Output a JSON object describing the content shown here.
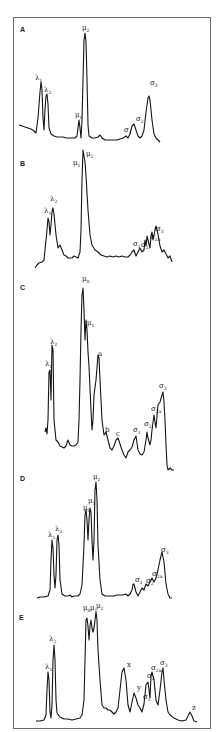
{
  "figure": {
    "panels": [
      {
        "id": "A",
        "letter": "A",
        "peak_labels": [
          "λ1",
          "λ2",
          "μ1",
          "μ2",
          "σ1",
          "σ2",
          "σ3"
        ]
      },
      {
        "id": "B",
        "letter": "B",
        "peak_labels": [
          "λ1",
          "λ2",
          "μ1",
          "μ2",
          "σ1",
          "σ2",
          "σ2a",
          "σ3"
        ]
      },
      {
        "id": "C",
        "letter": "C",
        "peak_labels": [
          "λ1",
          "λ2",
          "μ0",
          "μ1",
          "a",
          "b",
          "c",
          "σ1",
          "σ2",
          "σ2a",
          "σ3"
        ]
      },
      {
        "id": "D",
        "letter": "D",
        "peak_labels": [
          "λ1",
          "λ2",
          "μ0",
          "μ1",
          "μ2",
          "σ1",
          "σ2",
          "σ2a",
          "σ3"
        ]
      },
      {
        "id": "E",
        "letter": "E",
        "peak_labels": [
          "λ1",
          "λ2",
          "μ0",
          "μ1",
          "μ2",
          "x",
          "y",
          "σ1",
          "σ2",
          "σ2a",
          "σ3",
          "z"
        ]
      }
    ]
  },
  "labels": {
    "A": {
      "letter": "A",
      "l1": "λ",
      "l1s": "1",
      "l2": "λ",
      "l2s": "2",
      "m1": "μ",
      "m1s": "1",
      "m2": "μ",
      "m2s": "2",
      "s1": "σ",
      "s1s": "1",
      "s2": "σ",
      "s2s": "2",
      "s3": "σ",
      "s3s": "3"
    },
    "B": {
      "letter": "B",
      "l1": "λ",
      "l1s": "1",
      "l2": "λ",
      "l2s": "2",
      "m1": "μ",
      "m1s": "1",
      "m2": "μ",
      "m2s": "2",
      "s1": "σ",
      "s1s": "1",
      "s2": "σ",
      "s2s": "2",
      "s2a": "σ",
      "s2as": "2a",
      "s3": "σ",
      "s3s": "3"
    },
    "C": {
      "letter": "C",
      "l1": "λ",
      "l1s": "1",
      "l2": "λ",
      "l2s": "2",
      "m0": "μ",
      "m0s": "0",
      "m1": "μ",
      "m1s": "1",
      "a": "a",
      "b": "b",
      "c": "c",
      "s1": "σ",
      "s1s": "1",
      "s2": "σ",
      "s2s": "2",
      "s2a": "σ",
      "s2as": "2a",
      "s3": "σ",
      "s3s": "3"
    },
    "D": {
      "letter": "D",
      "l1": "λ",
      "l1s": "1",
      "l2": "λ",
      "l2s": "2",
      "m0": "μ",
      "m0s": "0",
      "m1": "μ",
      "m1s": "1",
      "m2": "μ",
      "m2s": "2",
      "s1": "σ",
      "s1s": "1",
      "s2": "σ",
      "s2s": "2",
      "s2a": "σ",
      "s2as": "2a",
      "s3": "σ",
      "s3s": "3"
    },
    "E": {
      "letter": "E",
      "l1": "λ",
      "l1s": "1",
      "l2": "λ",
      "l2s": "2",
      "m0": "μ",
      "m0s": "0",
      "m1": "μ",
      "m1s": "1",
      "m2": "μ",
      "m2s": "2",
      "x": "x",
      "y": "y",
      "s1": "σ",
      "s1s": "1",
      "s2": "σ",
      "s2s": "2",
      "s2a": "σ",
      "s2as": "2a",
      "s3": "σ",
      "s3s": "3",
      "z": "z"
    }
  }
}
